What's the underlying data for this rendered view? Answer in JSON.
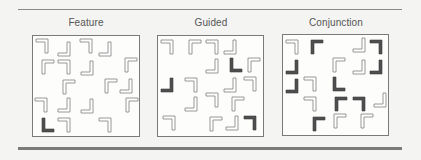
{
  "figure": {
    "panels": [
      {
        "id": "feature",
        "label": "Feature",
        "box": {
          "x": 32,
          "y": 35,
          "w": 108,
          "h": 102
        },
        "items": [
          {
            "x": 35,
            "y": 38,
            "corner": "tr",
            "style": "outline"
          },
          {
            "x": 57,
            "y": 41,
            "corner": "br",
            "style": "outline"
          },
          {
            "x": 79,
            "y": 38,
            "corner": "tr",
            "style": "outline"
          },
          {
            "x": 98,
            "y": 41,
            "corner": "br",
            "style": "outline"
          },
          {
            "x": 41,
            "y": 59,
            "corner": "tl",
            "style": "outline"
          },
          {
            "x": 57,
            "y": 59,
            "corner": "tr",
            "style": "outline"
          },
          {
            "x": 80,
            "y": 60,
            "corner": "br",
            "style": "outline"
          },
          {
            "x": 124,
            "y": 57,
            "corner": "tl",
            "style": "outline"
          },
          {
            "x": 62,
            "y": 79,
            "corner": "tl",
            "style": "outline"
          },
          {
            "x": 104,
            "y": 78,
            "corner": "tl",
            "style": "outline"
          },
          {
            "x": 119,
            "y": 78,
            "corner": "br",
            "style": "outline"
          },
          {
            "x": 34,
            "y": 97,
            "corner": "tr",
            "style": "outline"
          },
          {
            "x": 57,
            "y": 97,
            "corner": "br",
            "style": "outline"
          },
          {
            "x": 80,
            "y": 98,
            "corner": "br",
            "style": "outline"
          },
          {
            "x": 125,
            "y": 97,
            "corner": "tl",
            "style": "outline"
          },
          {
            "x": 41,
            "y": 117,
            "corner": "bl",
            "style": "solid"
          },
          {
            "x": 57,
            "y": 117,
            "corner": "tr",
            "style": "outline"
          },
          {
            "x": 98,
            "y": 117,
            "corner": "tr",
            "style": "outline"
          }
        ]
      },
      {
        "id": "guided",
        "label": "Guided",
        "box": {
          "x": 157,
          "y": 35,
          "w": 107,
          "h": 102
        },
        "items": [
          {
            "x": 160,
            "y": 39,
            "corner": "tr",
            "style": "outline"
          },
          {
            "x": 188,
            "y": 39,
            "corner": "tl",
            "style": "outline"
          },
          {
            "x": 205,
            "y": 39,
            "corner": "tr",
            "style": "outline"
          },
          {
            "x": 223,
            "y": 39,
            "corner": "br",
            "style": "outline"
          },
          {
            "x": 205,
            "y": 58,
            "corner": "br",
            "style": "outline"
          },
          {
            "x": 229,
            "y": 57,
            "corner": "bl",
            "style": "solid"
          },
          {
            "x": 247,
            "y": 57,
            "corner": "tl",
            "style": "outline"
          },
          {
            "x": 160,
            "y": 77,
            "corner": "br",
            "style": "solid"
          },
          {
            "x": 184,
            "y": 77,
            "corner": "tr",
            "style": "outline"
          },
          {
            "x": 223,
            "y": 77,
            "corner": "br",
            "style": "outline"
          },
          {
            "x": 243,
            "y": 76,
            "corner": "tr",
            "style": "outline"
          },
          {
            "x": 184,
            "y": 96,
            "corner": "br",
            "style": "outline"
          },
          {
            "x": 205,
            "y": 92,
            "corner": "tr",
            "style": "outline"
          },
          {
            "x": 231,
            "y": 96,
            "corner": "tl",
            "style": "outline"
          },
          {
            "x": 162,
            "y": 115,
            "corner": "tr",
            "style": "outline"
          },
          {
            "x": 209,
            "y": 116,
            "corner": "tl",
            "style": "outline"
          },
          {
            "x": 225,
            "y": 115,
            "corner": "br",
            "style": "outline"
          },
          {
            "x": 243,
            "y": 115,
            "corner": "tr",
            "style": "solid"
          }
        ]
      },
      {
        "id": "conjunction",
        "label": "Conjunction",
        "box": {
          "x": 282,
          "y": 34,
          "w": 107,
          "h": 102
        },
        "items": [
          {
            "x": 285,
            "y": 39,
            "corner": "tr",
            "style": "outline"
          },
          {
            "x": 310,
            "y": 39,
            "corner": "tl",
            "style": "solid"
          },
          {
            "x": 352,
            "y": 37,
            "corner": "br",
            "style": "outline"
          },
          {
            "x": 369,
            "y": 39,
            "corner": "tr",
            "style": "solid"
          },
          {
            "x": 285,
            "y": 59,
            "corner": "br",
            "style": "solid"
          },
          {
            "x": 332,
            "y": 57,
            "corner": "tl",
            "style": "outline"
          },
          {
            "x": 352,
            "y": 59,
            "corner": "br",
            "style": "outline"
          },
          {
            "x": 369,
            "y": 59,
            "corner": "br",
            "style": "solid"
          },
          {
            "x": 285,
            "y": 78,
            "corner": "br",
            "style": "solid"
          },
          {
            "x": 303,
            "y": 76,
            "corner": "tr",
            "style": "outline"
          },
          {
            "x": 332,
            "y": 76,
            "corner": "bl",
            "style": "solid"
          },
          {
            "x": 303,
            "y": 96,
            "corner": "tr",
            "style": "outline"
          },
          {
            "x": 334,
            "y": 96,
            "corner": "tl",
            "style": "solid"
          },
          {
            "x": 352,
            "y": 96,
            "corner": "tr",
            "style": "solid"
          },
          {
            "x": 373,
            "y": 92,
            "corner": "br",
            "style": "outline"
          },
          {
            "x": 312,
            "y": 116,
            "corner": "tl",
            "style": "solid"
          },
          {
            "x": 333,
            "y": 113,
            "corner": "tl",
            "style": "outline"
          },
          {
            "x": 360,
            "y": 113,
            "corner": "tl",
            "style": "outline"
          }
        ]
      }
    ]
  },
  "colors": {
    "background": "#f4f4f2",
    "panel_fill": "#fdfdfc",
    "outline_stroke": "#8c8c8c",
    "outline_fill": "#ffffff",
    "solid_fill": "#4f4f4f"
  }
}
